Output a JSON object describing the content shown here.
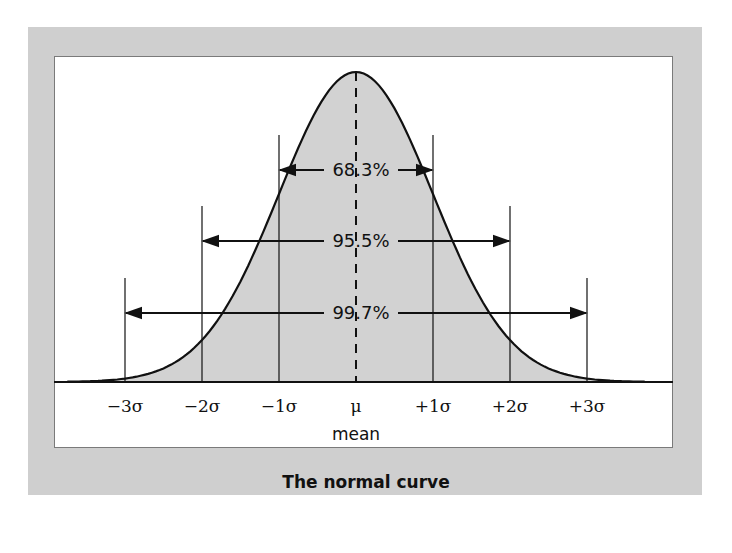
{
  "caption": "The normal curve",
  "colors": {
    "frame": "#cfcfcf",
    "fill": "#d2d2d2",
    "line": "#111111"
  },
  "axis": {
    "ticks": [
      "−3σ",
      "−2σ",
      "−1σ",
      "μ",
      "+1σ",
      "+2σ",
      "+3σ"
    ],
    "mean_label": "mean"
  },
  "intervals": [
    {
      "label": "68.3%",
      "range": "±1σ"
    },
    {
      "label": "95.5%",
      "range": "±2σ"
    },
    {
      "label": "99.7%",
      "range": "±3σ"
    }
  ],
  "chart_data": {
    "type": "area",
    "title": "The normal curve",
    "xlabel": "mean",
    "ylabel": "",
    "x_ticks": [
      "-3σ",
      "-2σ",
      "-1σ",
      "μ",
      "+1σ",
      "+2σ",
      "+3σ"
    ],
    "x": [
      -3.7,
      -3,
      -2,
      -1,
      0,
      1,
      2,
      3,
      3.7
    ],
    "values": [
      0.0004,
      0.0044,
      0.054,
      0.242,
      0.399,
      0.242,
      0.054,
      0.0044,
      0.0004
    ],
    "annotations": [
      {
        "text": "68.3%",
        "from": -1,
        "to": 1
      },
      {
        "text": "95.5%",
        "from": -2,
        "to": 2
      },
      {
        "text": "99.7%",
        "from": -3,
        "to": 3
      }
    ],
    "grid": false,
    "legend": "none"
  }
}
